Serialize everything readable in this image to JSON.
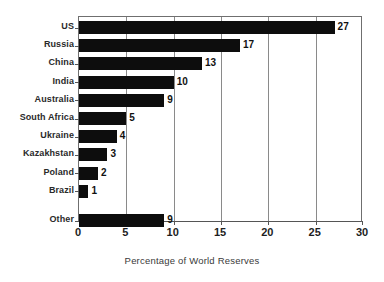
{
  "chart_data": {
    "type": "bar",
    "orientation": "horizontal",
    "title": "",
    "xlabel": "Percentage of World Reserves",
    "ylabel": "",
    "xlim": [
      0,
      30
    ],
    "xticks": [
      0,
      5,
      10,
      15,
      20,
      25,
      30
    ],
    "grid": true,
    "legend": false,
    "bar_color": "#0d0d0d",
    "categories": [
      "US",
      "Russia",
      "China",
      "India",
      "Australia",
      "South Africa",
      "Ukraine",
      "Kazakhstan",
      "Poland",
      "Brazil",
      "Other"
    ],
    "values": [
      27,
      17,
      13,
      10,
      9,
      5,
      4,
      3,
      2,
      1,
      9
    ],
    "data_labels": [
      "27",
      "17",
      "13",
      "10",
      "9",
      "5",
      "4",
      "3",
      "2",
      "1",
      "9"
    ],
    "xtick_labels": [
      "0",
      "5",
      "10",
      "15",
      "20",
      "25",
      "30"
    ]
  }
}
